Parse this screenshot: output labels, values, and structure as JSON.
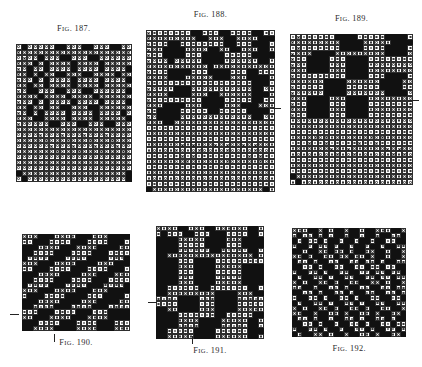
{
  "page": {
    "clipped_header_text": "",
    "background_color": "#ffffff",
    "ink_color": "#111111",
    "figure_count": 6
  },
  "legend": {
    "cell_types": [
      {
        "code": "f",
        "name": "filled-square",
        "meaning": "warp up / black square"
      },
      {
        "code": "o",
        "name": "open-square-with-circle",
        "meaning": "warp down / empty square"
      },
      {
        "code": "x",
        "name": "cross-square",
        "meaning": "tie-up / cross mark"
      },
      {
        "code": "b",
        "name": "blank-cell",
        "meaning": "no mark"
      }
    ]
  },
  "figures": [
    {
      "id": "fig-187",
      "caption": "FIG. 187.",
      "caption_lead": "F",
      "caption_small": "IG",
      "caption_tail": ". 187.",
      "caption_position": "top",
      "left": 16,
      "top": 44,
      "cell": 5.5,
      "cols": 21,
      "rows": 25,
      "ticks": [],
      "rows_data": [
        "ofoooooffoooffoooffoo",
        "xooooooooooooooooooox",
        "oxoofoooffoooffoooooox",
        "xoofofoooofoooofooooox",
        "xofoofoooofoooofoooofx",
        "xofofooffoooffoooofoox",
        "xoofofoooofoooofoooofx",
        "xofoofoooofoooofooooox",
        "xoffoooffoooffoooooofx",
        "xooofoooofoooofoooooox",
        "xoofofoooofoooofoooofx",
        "xofoofooffoooffoooooox",
        "xofofoooofoooofoooofox",
        "xooffoooofoooofooooofx",
        "xoooooffoooffoooffooox",
        "ooooooooooooooooooooo",
        "ooooxoooxoooxoooxoooo",
        "oooooxoooxoooxoooxooo",
        "ooooooxoooxoooxoooxoo",
        "oooooooxoooxoooxoooxo",
        "ooooooooooooooooooooo",
        "ooooooooooooooooooooo",
        "ooooooooooooooooooooo",
        "fooooooooooooooooooof",
        "ofoooooooooooooooooof"
      ]
    },
    {
      "id": "fig-188",
      "caption": "FIG. 188.",
      "caption_lead": "F",
      "caption_small": "IG",
      "caption_tail": ". 188.",
      "caption_position": "top",
      "left": 146,
      "top": 30,
      "cell": 5.6,
      "cols": 23,
      "rows": 29,
      "ticks": [
        {
          "side": "right",
          "x": 272,
          "y": 108
        }
      ],
      "rows_data": [
        "xoooooooffoooffooooffo",
        "xooooooooffoooffoooofff",
        "xoooffooooooooffooofffo",
        "xooffffooooffooffoooffo",
        "xooffffoooffffoooooffff",
        "xooofoooooffffooooooffo",
        "xoooooooooofoooooooooo",
        "xoooffffoooffffoooffooo",
        "xooofffooooofffoooffffo",
        "xoooooooooooooooooofffo",
        "xoooofffoooooooooooffoo",
        "xoooffffoooffoooooofffo",
        "xoooooooooffffoooooffoo",
        "xooffffoooffffooofffooo",
        "xoffffoooooffoooooffffo",
        "xoffffoooooooooooooffoo",
        "xooffoooooooooooooooooo",
        "oooooooooooooooooooooo",
        "oooooooooooooooooooooo",
        "oooooooooooooooooooooo",
        "ooooooxoxoooxoxooxoxoo",
        "oooooxoooxooooxooooxoo",
        "ooooooxoxoooooooooxoxo",
        "oooooooxooooooxoooooxo",
        "oooooooooooooooooooooo",
        "oooooooooooooooooooooo",
        "oooooooooooooooooooooo",
        "oooooooooooooooooooooo",
        "foooooooooooooooooooof"
      ]
    },
    {
      "id": "fig-189",
      "caption": "FIG. 189.",
      "caption_lead": "F",
      "caption_small": "IG",
      "caption_tail": ". 189.",
      "caption_position": "top",
      "left": 290,
      "top": 34,
      "cell": 5.6,
      "cols": 22,
      "rows": 27,
      "ticks": [
        {
          "side": "right",
          "x": 410,
          "y": 100
        }
      ],
      "rows_data": [
        "oxooooooffffoooooffff",
        "xooooooooffffoooooffff",
        "oxoooooooffffooooffff",
        "xoooffffoooooooooffff",
        "xooffffoooffffoooooooo",
        "xooffffoooffffoooooooo",
        "xooffffoooffffoooooooo",
        "xoooooooooffffoooffff",
        "xoooooffffooooooffff",
        "xoooooffffooooooffff",
        "xoooooffffoooooooffff",
        "xooffffoooffffoooooooo",
        "xooffffoooffffoooooooo",
        "xooffffoooffffoooooooo",
        "xooffffoooffffoooooooo",
        "oooooooooooooooooooo",
        "oooooooooooooooooooo",
        "oooooooooooooooooooo",
        "ooooxoxoooooooxoxooo",
        "oooxooxoooooxooxooooo",
        "oooooooxooxooooooxoxo",
        "ooooooooxooxooooooxox",
        "oooooooooooooooooooo",
        "oooooooooooooooooooo",
        "oooooooooooooooooooo",
        "foooooooooooooooooooo",
        "ofooooooooooooooooooo"
      ]
    },
    {
      "id": "fig-190",
      "caption": "FIG. 190.",
      "caption_lead": "F",
      "caption_small": "IG",
      "caption_tail": ". 190.",
      "caption_position": "bottom",
      "left": 22,
      "top": 234,
      "cell": 5.4,
      "cols": 20,
      "rows": 18,
      "ticks": [
        {
          "side": "left",
          "x": 10,
          "y": 314
        },
        {
          "side": "bottom",
          "x": 54,
          "y": 334
        }
      ],
      "rows_data": [
        "ooofffoooofffoooffff",
        "oofffoooofffoooofffo",
        "fffoooofffooooffffoo",
        "ffoooofffoooofffoooo",
        "foooofffooooffffooof",
        "ooofffooooffffooofff",
        "oofffoooofffoooofffo",
        "fffooooffffooofffooo",
        "ffoooofffoooofffoooo",
        "foooofffoooofffoooof",
        "ooofffoooofffoooffff",
        "offfooooffffoooffffo",
        "fffooooffffoooffffoo",
        "ffoooofffoooofffoooo",
        "ooofffoooofffoooffff",
        "oofffoooofffooooffff",
        "fffoooofffoooofffooo",
        "ffooooffffoooofffooo"
      ]
    },
    {
      "id": "fig-191",
      "caption": "FIG. 191.",
      "caption_lead": "F",
      "caption_small": "IG",
      "caption_tail": ". 191.",
      "caption_position": "bottom",
      "left": 156,
      "top": 226,
      "cell": 5.4,
      "cols": 20,
      "rows": 21,
      "ticks": [
        {
          "side": "left",
          "x": 148,
          "y": 302
        },
        {
          "side": "bottom",
          "x": 192,
          "y": 336
        }
      ],
      "rows_data": [
        "ooooffoooffooooooffo",
        "ofoooffooofffooooffo",
        "ffffoooooffffoooffff",
        "ffffoooooffffoooffff",
        "ffffooooooffoooooffo",
        "ffoooooooooooooooofo",
        "ffffoooffffooooooooo",
        "ffffoooffffoooooffff",
        "ffffoooffffoooooffff",
        "ffffoooffffoooooffff",
        "ffffoooffffoooooffff",
        "ffooooooffoooooooffo",
        "ffoooooooooffffoooff",
        "ooooffffoooffffooooo",
        "ooooffffoooffffooooo",
        "ffooffffoooffffooooo",
        "ffffoooooooffoooooff",
        "ffffooooffffoooooffo",
        "ffffooooffffoooooffo",
        "ffoooooffffoooooofff",
        "ffoooooffffooooooffo"
      ]
    },
    {
      "id": "fig-192",
      "caption": "FIG. 192.",
      "caption_lead": "F",
      "caption_small": "IG",
      "caption_tail": ". 192.",
      "caption_position": "bottom",
      "left": 292,
      "top": 228,
      "cell": 5.2,
      "cols": 22,
      "rows": 21,
      "ticks": [],
      "rows_data": [
        "oooffofoffoffoffoooffo",
        "ofoofofoffoffoffoffoof",
        "fofoofoffoffoffoffooff",
        "offofoofoffoffoffoffoo",
        "ffoffoofoofoffooffoffo",
        "oofoffoofoofoofoffoffo",
        "foofoffooffoofoofoffoo",
        "ffoofoffooffoofoofooff",
        "offoofoffooffoofoofoof",
        "foffoofoffooffoofoofoo",
        "ofoffoofoffooffoofoffo",
        "ooffoffoofoffooffoofoo",
        "ffoofoffoofoffooffoofo",
        "offoofoffoofoffooffoof",
        "foffoofoffoofoffooffoo",
        "ofoffoofoffoofoffooffo",
        "ooffoffoofoffoofoffoof",
        "foofoffoffoofoffoofoff",
        "ffoofoffoffoofoffoofoo",
        "offoofoffoffoofoffoofo",
        "foffoofoffoffoofoffoof"
      ]
    }
  ]
}
